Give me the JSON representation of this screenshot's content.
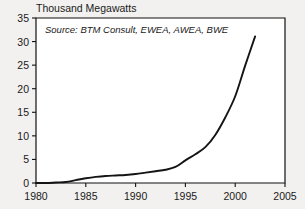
{
  "chart_data": {
    "type": "line",
    "title": "Thousand Megawatts",
    "xlabel": "",
    "ylabel": "Thousand Megawatts",
    "annotation": "Source: BTM Consult, EWEA, AWEA, BWE",
    "grid": false,
    "legend": "none",
    "xlim": [
      1980,
      2005
    ],
    "ylim": [
      0,
      35
    ],
    "xticks": [
      1980,
      1985,
      1990,
      1995,
      2000,
      2005
    ],
    "yticks": [
      0,
      5,
      10,
      15,
      20,
      25,
      30,
      35
    ],
    "xtick_labels": [
      "1980",
      "1985",
      "1990",
      "1995",
      "2000",
      "2005"
    ],
    "ytick_labels": [
      "0",
      "5",
      "10",
      "15",
      "20",
      "25",
      "30",
      "35"
    ],
    "series": [
      {
        "name": "World Wind Energy Generating Capacity",
        "color": "#141414",
        "x": [
          1980,
          1981,
          1982,
          1983,
          1984,
          1985,
          1986,
          1987,
          1988,
          1989,
          1990,
          1991,
          1992,
          1993,
          1994,
          1995,
          1996,
          1997,
          1998,
          1999,
          2000,
          2001,
          2002
        ],
        "values": [
          0.0,
          0.0,
          0.1,
          0.2,
          0.6,
          1.0,
          1.3,
          1.5,
          1.6,
          1.7,
          1.9,
          2.2,
          2.5,
          2.8,
          3.4,
          4.8,
          6.1,
          7.6,
          10.2,
          13.9,
          18.4,
          24.9,
          31.1
        ]
      }
    ]
  },
  "colors": {
    "background": "#f2f1ef",
    "axis": "#111111",
    "text": "#1a1a1a",
    "line": "#141414"
  }
}
